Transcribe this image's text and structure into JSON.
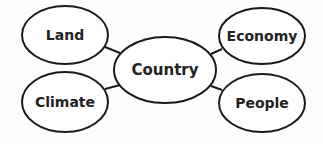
{
  "diagram": {
    "type": "concept-web",
    "colors": {
      "stroke": "#1a1a1a",
      "fill": "#ffffff",
      "text": "#222222"
    },
    "center": {
      "id": "country",
      "label": "Country",
      "cx": 165,
      "cy": 70,
      "rx": 51,
      "ry": 33,
      "font_size": 15
    },
    "nodes": [
      {
        "id": "land",
        "label": "Land",
        "cx": 65,
        "cy": 35,
        "rx": 43,
        "ry": 29,
        "font_size": 14
      },
      {
        "id": "climate",
        "label": "Climate",
        "cx": 65,
        "cy": 102,
        "rx": 43,
        "ry": 30,
        "font_size": 14
      },
      {
        "id": "economy",
        "label": "Economy",
        "cx": 262,
        "cy": 36,
        "rx": 43,
        "ry": 28,
        "font_size": 14
      },
      {
        "id": "people",
        "label": "People",
        "cx": 262,
        "cy": 103,
        "rx": 43,
        "ry": 29,
        "font_size": 14
      }
    ],
    "edges": [
      {
        "from": "land",
        "to": "country",
        "x1": 105,
        "y1": 47,
        "x2": 120,
        "y2": 53
      },
      {
        "from": "climate",
        "to": "country",
        "x1": 105,
        "y1": 89,
        "x2": 120,
        "y2": 85
      },
      {
        "from": "economy",
        "to": "country",
        "x1": 222,
        "y1": 49,
        "x2": 211,
        "y2": 54
      },
      {
        "from": "people",
        "to": "country",
        "x1": 222,
        "y1": 90,
        "x2": 211,
        "y2": 86
      }
    ]
  }
}
